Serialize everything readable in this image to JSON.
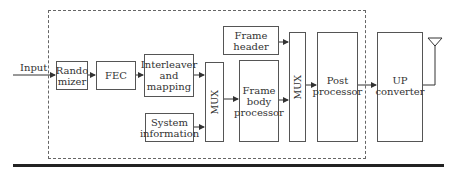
{
  "diagram": {
    "input_label": "Input",
    "blocks": {
      "randomizer": "Rando\nmizer",
      "fec": "FEC",
      "interleaver": "Interleaver\nand\nmapping",
      "system_info": "System\ninformation",
      "mux1": "MUX",
      "frame_header": "Frame\nheader",
      "frame_body": "Frame\nbody\nprocessor",
      "mux2": "MUX",
      "post_processor": "Post\nprocessor",
      "up_converter": "UP\nconverter"
    },
    "colors": {
      "line": "#333333",
      "box_border": "#555555",
      "bottom_rule": "#222222"
    }
  }
}
